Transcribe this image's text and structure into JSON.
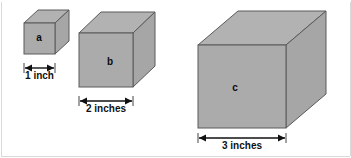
{
  "figure": {
    "background_color": "#ffffff",
    "face_fill_front": "#ababab",
    "face_fill_top": "#b2b2b2",
    "face_fill_side": "#a6a6a6",
    "edge_color": "#5a5a5a",
    "dimension_color": "#111111",
    "frame_color": "#d9d9d9"
  },
  "cubes": [
    {
      "label": "a",
      "dimension_label": "1 inch",
      "edge_inches": 1,
      "front": {
        "x": 24,
        "y": 23,
        "w": 31,
        "h": 31
      },
      "depth": {
        "dx": 14,
        "dy": -13
      },
      "label_pos": {
        "x": 39,
        "y": 38
      },
      "dim": {
        "x1": 24,
        "x2": 55,
        "y": 68,
        "text_y": 72
      }
    },
    {
      "label": "b",
      "dimension_label": "2 inches",
      "edge_inches": 2,
      "front": {
        "x": 79,
        "y": 33,
        "w": 54,
        "h": 54
      },
      "depth": {
        "dx": 22,
        "dy": -21
      },
      "label_pos": {
        "x": 110,
        "y": 62
      },
      "dim": {
        "x1": 79,
        "x2": 133,
        "y": 101,
        "text_y": 105
      }
    },
    {
      "label": "c",
      "dimension_label": "3 inches",
      "edge_inches": 3,
      "front": {
        "x": 198,
        "y": 45,
        "w": 88,
        "h": 83
      },
      "depth": {
        "dx": 40,
        "dy": -34
      },
      "label_pos": {
        "x": 235,
        "y": 88
      },
      "dim": {
        "x1": 198,
        "x2": 286,
        "y": 138,
        "text_y": 142
      }
    }
  ]
}
